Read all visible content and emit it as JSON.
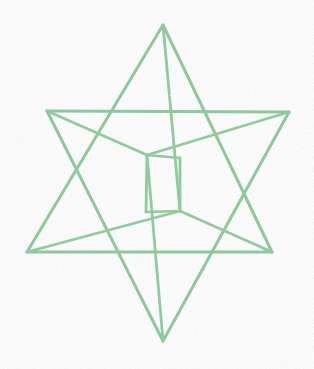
{
  "page": {
    "background_color": "#ffffff",
    "width": 314,
    "height": 369
  },
  "figure": {
    "name": "merkaba-star-tetrahedron",
    "stroke_color": "#90ce9f",
    "stroke_color_light": "#a9dcb5",
    "stroke_width": 3.0,
    "stroke_width_inner": 2.8,
    "style": "hand-drawn marker wireframe",
    "vertices": {
      "top_apex": [
        163,
        25
      ],
      "bottom_apex": [
        163,
        341
      ],
      "upper_left_point": [
        47,
        111
      ],
      "upper_right_point": [
        289,
        112
      ],
      "lower_left_point": [
        27,
        252
      ],
      "lower_right_point": [
        272,
        252
      ],
      "inner_upper_left": [
        105,
        137
      ],
      "inner_upper_right": [
        222,
        139
      ],
      "inner_left": [
        147,
        155
      ],
      "inner_right": [
        180,
        158
      ],
      "inner_lower_left": [
        146,
        212
      ],
      "inner_lower_right": [
        180,
        211
      ],
      "inner_bottom": [
        163,
        210
      ],
      "rear_upper": [
        163,
        113
      ],
      "rear_lower": [
        163,
        252
      ]
    },
    "edges": [
      {
        "id": "up-tet-left",
        "name": "upward-tetra-left-edge",
        "path": "M 163 25 L 27 252"
      },
      {
        "id": "up-tet-right",
        "name": "upward-tetra-right-edge",
        "path": "M 163 25 L 272 252"
      },
      {
        "id": "up-tet-base",
        "name": "upward-tetra-base-edge",
        "path": "M 27 252 L 272 252"
      },
      {
        "id": "up-tet-rear-a",
        "name": "upward-tetra-rear-edge-left",
        "path": "M 163 25 L 180 211"
      },
      {
        "id": "up-tet-rear-b",
        "name": "upward-tetra-rear-edge-lower-left",
        "path": "M 27 252 L 180 211"
      },
      {
        "id": "up-tet-rear-c",
        "name": "upward-tetra-rear-edge-lower-right",
        "path": "M 272 252 L 180 211"
      },
      {
        "id": "dn-tet-left",
        "name": "downward-tetra-left-edge",
        "path": "M 163 341 L 47 111"
      },
      {
        "id": "dn-tet-right",
        "name": "downward-tetra-right-edge",
        "path": "M 163 341 L 289 112"
      },
      {
        "id": "dn-tet-top",
        "name": "downward-tetra-top-edge",
        "path": "M 47 111 L 289 112"
      },
      {
        "id": "dn-tet-rear-a",
        "name": "downward-tetra-rear-edge-apex",
        "path": "M 163 341 L 147 155"
      },
      {
        "id": "dn-tet-rear-b",
        "name": "downward-tetra-rear-edge-upper-left",
        "path": "M 47 111 L 147 155"
      },
      {
        "id": "dn-tet-rear-c",
        "name": "downward-tetra-rear-edge-upper-right",
        "path": "M 289 112 L 147 155"
      },
      {
        "id": "core-left-vert",
        "name": "inner-core-left-vertical-edge",
        "path": "M 147 155 L 146 212"
      },
      {
        "id": "core-right-vert",
        "name": "inner-core-right-vertical-edge",
        "path": "M 180 158 L 180 211"
      },
      {
        "id": "core-top-link",
        "name": "inner-core-top-link-edge",
        "path": "M 147 155 L 180 158"
      },
      {
        "id": "core-bottom-link",
        "name": "inner-core-bottom-link-edge",
        "path": "M 146 212 L 180 211"
      }
    ],
    "shape_description": "stellated octahedron / star tetrahedron wireframe",
    "point_count": 6,
    "tetrahedra_count": 2
  }
}
